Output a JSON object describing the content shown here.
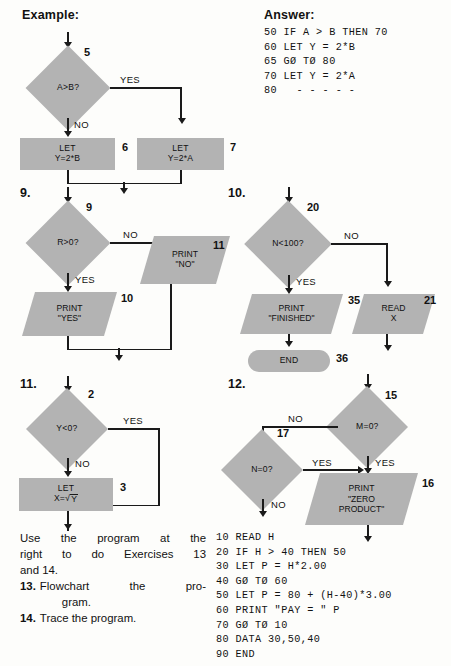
{
  "headings": {
    "example": "Example:",
    "answer": "Answer:"
  },
  "answer_code": "50 IF A > B THEN 70\n60 LET Y = 2*B\n65 GØ TØ 80\n70 LET Y = 2*A\n80   - - - - -",
  "example": {
    "step_numbers": {
      "decision": "5",
      "left_box": "6",
      "right_box": "7"
    },
    "decision": "A>B?",
    "yes_label": "YES",
    "no_label": "NO",
    "left_box_line1": "LET",
    "left_box_line2": "Y=2*B",
    "right_box_line1": "LET",
    "right_box_line2": "Y=2*A"
  },
  "ex9": {
    "number": "9.",
    "step_numbers": {
      "decision": "9",
      "print_yes": "10",
      "print_no": "11"
    },
    "decision": "R>0?",
    "yes_label": "YES",
    "no_label": "NO",
    "print_yes_line1": "PRINT",
    "print_yes_line2": "\"YES\"",
    "print_no_line1": "PRINT",
    "print_no_line2": "\"NO\""
  },
  "ex10": {
    "number": "10.",
    "step_numbers": {
      "decision": "20",
      "print_finished": "35",
      "read_x": "21",
      "end": "36"
    },
    "decision": "N<100?",
    "yes_label": "YES",
    "no_label": "NO",
    "print_line1": "PRINT",
    "print_line2": "\"FINISHED\"",
    "read_line1": "READ",
    "read_line2": "X",
    "end_label": "END"
  },
  "ex11": {
    "number": "11.",
    "step_numbers": {
      "decision": "2",
      "let_box": "3"
    },
    "decision": "Y<0?",
    "yes_label": "YES",
    "no_label": "NO",
    "let_line1": "LET",
    "let_line2_prefix": "X=",
    "let_line2_radicand": "Y"
  },
  "ex12": {
    "number": "12.",
    "step_numbers": {
      "m_decision": "15",
      "n_decision": "17",
      "print_box": "16"
    },
    "m_decision": "M=0?",
    "n_decision": "N=0?",
    "m_no_label": "NO",
    "m_yes_label": "YES",
    "n_yes_label": "YES",
    "n_no_label": "NO",
    "print_line1": "PRINT",
    "print_line2": "\"ZERO",
    "print_line3": "PRODUCT\""
  },
  "instructions": {
    "intro_line1": "Use the program at the",
    "intro_line2": "right to do Exercises 13",
    "intro_line3": "and 14.",
    "items": [
      {
        "num": "13.",
        "text_line1": "Flowchart the pro-",
        "text_line2": "gram."
      },
      {
        "num": "14.",
        "text_line1": "Trace the program.",
        "text_line2": ""
      }
    ]
  },
  "program_code": "10 READ H\n20 IF H > 40 THEN 50\n30 LET P = H*2.00\n40 GØ TØ 60\n50 LET P = 80 + (H-40)*3.00\n60 PRINT \"PAY = \" P\n70 GØ TØ 10\n80 DATA 30,50,40\n90 END",
  "colors": {
    "shape_fill": "#b3b3b3",
    "line": "#1a1a1a",
    "background": "#fdfdfb"
  }
}
